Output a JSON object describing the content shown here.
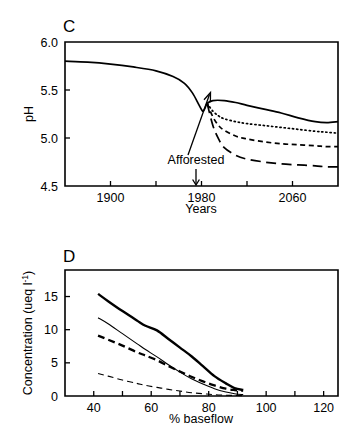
{
  "figure": {
    "panels": [
      "C",
      "D"
    ]
  },
  "chart_data": [
    {
      "panel_label": "C",
      "type": "line",
      "title": "",
      "xlabel": "Years",
      "ylabel": "pH",
      "xlim": [
        1860,
        2100
      ],
      "ylim": [
        4.5,
        6.0
      ],
      "xticks": [
        1860,
        1900,
        1940,
        1980,
        2020,
        2060,
        2100
      ],
      "xticklabels": [
        "",
        "1900",
        "",
        "1980",
        "",
        "2060",
        ""
      ],
      "yticks": [
        4.5,
        5.0,
        5.5,
        6.0
      ],
      "yticklabels": [
        "4.5",
        "5.0",
        "5.5",
        "6.0"
      ],
      "grid": false,
      "legend": "none",
      "annotations": [
        {
          "text": "Afforested",
          "x": 1980,
          "y": 4.72,
          "arrow_to_year": 1980
        }
      ],
      "series": [
        {
          "name": "baseline / no further afforestation",
          "style": "solid",
          "x": [
            1860,
            1880,
            1900,
            1920,
            1940,
            1955,
            1965,
            1972,
            1978,
            1981,
            1983,
            1985,
            1990,
            2000,
            2010,
            2020,
            2035,
            2050,
            2065,
            2080,
            2090,
            2100
          ],
          "y": [
            5.8,
            5.79,
            5.77,
            5.74,
            5.7,
            5.64,
            5.57,
            5.47,
            5.34,
            5.28,
            5.31,
            5.36,
            5.39,
            5.39,
            5.37,
            5.34,
            5.3,
            5.26,
            5.21,
            5.17,
            5.16,
            5.17
          ]
        },
        {
          "name": "scenario 2",
          "style": "dotted",
          "x": [
            1985,
            1990,
            1995,
            2000,
            2010,
            2020,
            2035,
            2050,
            2065,
            2080,
            2090,
            2100
          ],
          "y": [
            5.36,
            5.28,
            5.23,
            5.2,
            5.17,
            5.15,
            5.13,
            5.11,
            5.09,
            5.07,
            5.06,
            5.05
          ]
        },
        {
          "name": "scenario 3",
          "style": "short-dash",
          "x": [
            1985,
            1990,
            1995,
            2000,
            2010,
            2020,
            2035,
            2050,
            2065,
            2080,
            2090,
            2100
          ],
          "y": [
            5.36,
            5.22,
            5.13,
            5.08,
            5.02,
            4.99,
            4.96,
            4.94,
            4.93,
            4.92,
            4.91,
            4.91
          ]
        },
        {
          "name": "scenario 4",
          "style": "long-dash",
          "x": [
            1985,
            1990,
            1995,
            2000,
            2010,
            2020,
            2035,
            2050,
            2065,
            2080,
            2090,
            2100
          ],
          "y": [
            5.36,
            5.13,
            4.99,
            4.9,
            4.82,
            4.78,
            4.75,
            4.73,
            4.72,
            4.71,
            4.7,
            4.7
          ]
        }
      ]
    },
    {
      "panel_label": "D",
      "type": "line",
      "title": "",
      "xlabel": "% baseflow",
      "ylabel": "Concentration (ueq l-1)",
      "ylabel_display": "Concentration (ueq l",
      "ylabel_sup": "-1",
      "ylabel_tail": ")",
      "xlim": [
        30,
        125
      ],
      "ylim": [
        0,
        19
      ],
      "xticks": [
        30,
        40,
        50,
        60,
        70,
        80,
        90,
        100,
        110,
        120
      ],
      "xticklabels": [
        "",
        "40",
        "",
        "60",
        "",
        "80",
        "",
        "100",
        "",
        "120"
      ],
      "yticks": [
        0,
        5,
        10,
        15
      ],
      "yticklabels": [
        "0",
        "5",
        "10",
        "15"
      ],
      "grid": false,
      "legend": "none",
      "series": [
        {
          "name": "series 1",
          "style": "thick-solid",
          "x": [
            41.5,
            45,
            50,
            55,
            58,
            62,
            66,
            70,
            74,
            78,
            82,
            86,
            89,
            92
          ],
          "y": [
            15.4,
            14.3,
            12.8,
            11.4,
            10.6,
            9.9,
            8.6,
            7.3,
            6.0,
            4.5,
            3.0,
            1.9,
            1.2,
            0.9
          ]
        },
        {
          "name": "series 2",
          "style": "thin-solid",
          "x": [
            41.5,
            45,
            50,
            55,
            58,
            62,
            66,
            70,
            74,
            78,
            82,
            86,
            89,
            92
          ],
          "y": [
            11.8,
            10.9,
            9.4,
            7.9,
            7.0,
            5.9,
            4.7,
            3.6,
            2.6,
            1.8,
            1.1,
            0.6,
            0.35,
            0.2
          ]
        },
        {
          "name": "series 3",
          "style": "thick-dash",
          "x": [
            41.5,
            45,
            50,
            55,
            58,
            62,
            66,
            70,
            74,
            78,
            82,
            86,
            89,
            92
          ],
          "y": [
            9.1,
            8.5,
            7.6,
            6.6,
            6.1,
            5.4,
            4.5,
            3.7,
            2.9,
            2.2,
            1.6,
            1.1,
            0.9,
            0.8
          ]
        },
        {
          "name": "series 4",
          "style": "thin-dash",
          "x": [
            41.5,
            45,
            50,
            55,
            58,
            62,
            66,
            70,
            74,
            78,
            82,
            86,
            89,
            92
          ],
          "y": [
            3.4,
            3.0,
            2.4,
            1.9,
            1.6,
            1.3,
            1.0,
            0.75,
            0.5,
            0.35,
            0.2,
            0.12,
            0.08,
            0.05
          ]
        }
      ]
    }
  ]
}
